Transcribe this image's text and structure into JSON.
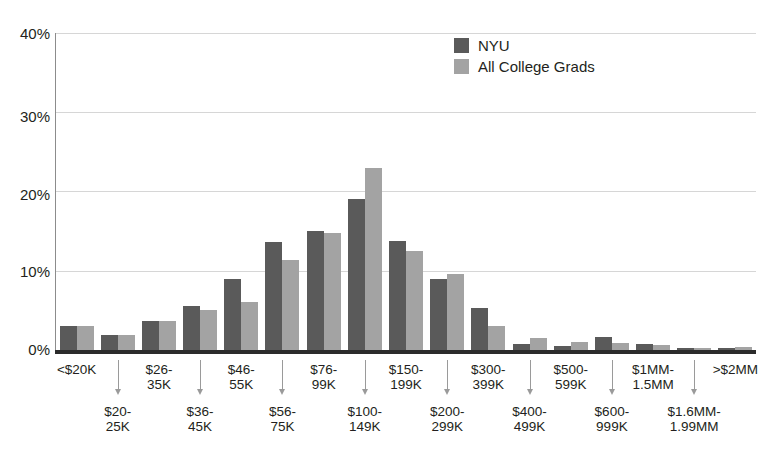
{
  "chart_data": {
    "type": "bar",
    "title": "",
    "subtitle": "",
    "xlabel": "",
    "ylabel": "",
    "ylim": [
      0,
      40
    ],
    "yticks": [
      0,
      10,
      20,
      30,
      40
    ],
    "ytick_labels": [
      "0%",
      "10%",
      "20%",
      "30%",
      "40%"
    ],
    "grid": "horizontal",
    "legend_position": "top-right",
    "categories": [
      "<$20K",
      "$20-25K",
      "$26-35K",
      "$36-45K",
      "$46-55K",
      "$56-75K",
      "$76-99K",
      "$100-149K",
      "$150-199K",
      "$200-299K",
      "$300-399K",
      "$400-499K",
      "$500-599K",
      "$600-999K",
      "$1MM-1.5MM",
      "$1.6MM-1.99MM",
      ">$2MM"
    ],
    "series": [
      {
        "name": "NYU",
        "color": "#5a5a5a",
        "values": [
          3.0,
          1.9,
          3.6,
          5.6,
          8.9,
          13.6,
          15.0,
          19.0,
          13.8,
          9.0,
          5.3,
          0.8,
          0.5,
          1.6,
          0.7,
          0.2,
          0.3
        ]
      },
      {
        "name": "All College Grads",
        "color": "#a3a3a3",
        "values": [
          3.0,
          1.9,
          3.6,
          5.0,
          6.0,
          11.3,
          14.8,
          23.0,
          12.5,
          9.6,
          3.0,
          1.5,
          1.0,
          0.9,
          0.6,
          0.2,
          0.4
        ]
      }
    ]
  },
  "legend": {
    "items": [
      {
        "label": "NYU",
        "color": "#5a5a5a"
      },
      {
        "label": "All College Grads",
        "color": "#a3a3a3"
      }
    ]
  },
  "y_axis": {
    "ticks": [
      {
        "label": "40%",
        "value": 40
      },
      {
        "label": "30%",
        "value": 30
      },
      {
        "label": "20%",
        "value": 20
      },
      {
        "label": "10%",
        "value": 10
      },
      {
        "label": "0%",
        "value": 0
      }
    ]
  },
  "x_axis": {
    "row_top": [
      "<$20K",
      "$26-\n35K",
      "$46-\n55K",
      "$76-\n99K",
      "$150-\n199K",
      "$300-\n399K",
      "$500-\n599K",
      "$1MM-\n1.5MM",
      ">$2MM"
    ],
    "row_bottom": [
      "$20-\n25K",
      "$36-\n45K",
      "$56-\n75K",
      "$100-\n149K",
      "$200-\n299K",
      "$400-\n499K",
      "$600-\n999K",
      "$1.6MM-\n1.99MM"
    ]
  },
  "colors": {
    "series_nyu": "#5a5a5a",
    "series_grads": "#a3a3a3",
    "gridline": "#d6d6d6",
    "axis": "#2b2b2b",
    "text": "#231f20",
    "background": "#ffffff"
  }
}
